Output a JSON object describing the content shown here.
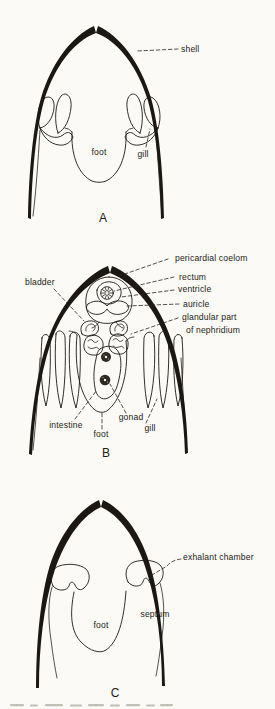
{
  "colors": {
    "paper": "#fbfaf6",
    "ink": "#1b1814"
  },
  "panel_a": {
    "letter": "A",
    "labels": {
      "shell": "shell",
      "foot": "foot",
      "gill": "gill"
    }
  },
  "panel_b": {
    "letter": "B",
    "labels": {
      "bladder": "bladder",
      "pericardial_coelom": "pericardial coelom",
      "rectum": "rectum",
      "ventricle": "ventricle",
      "auricle": "auricle",
      "glandular_line1": "glandular part",
      "glandular_line2": "of nephridium",
      "intestine": "intestine",
      "foot": "foot",
      "gonad": "gonad",
      "gill": "gill"
    }
  },
  "panel_c": {
    "letter": "C",
    "labels": {
      "exhalant_chamber": "exhalant chamber",
      "septum": "septum",
      "foot": "foot"
    }
  }
}
